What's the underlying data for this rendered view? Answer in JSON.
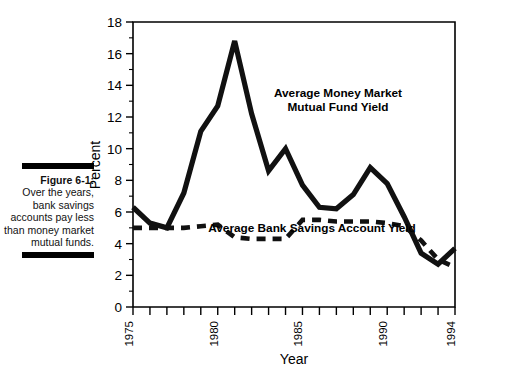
{
  "caption": {
    "label": "Figure 6-1:",
    "body": "Over the years, bank savings accounts pay less than money market mutual funds."
  },
  "chart_data": {
    "type": "line",
    "title": "",
    "xlabel": "Year",
    "ylabel": "Percent",
    "ylim": [
      0,
      18
    ],
    "ytick_step": 2,
    "yticks": [
      "0",
      "2",
      "4",
      "6",
      "8",
      "10",
      "12",
      "14",
      "16",
      "18"
    ],
    "xlim": [
      1975,
      1994
    ],
    "x": [
      1975,
      1976,
      1977,
      1978,
      1979,
      1980,
      1981,
      1982,
      1983,
      1984,
      1985,
      1986,
      1987,
      1988,
      1989,
      1990,
      1991,
      1992,
      1993,
      1994
    ],
    "xticks_labeled": [
      "1975",
      "1980",
      "1985",
      "1990",
      "1994"
    ],
    "xticks_labeled_values": [
      1975,
      1980,
      1985,
      1990,
      1994
    ],
    "grid": false,
    "legend_position": "inline-annotation",
    "series": [
      {
        "name": "Average Money Market Mutual Fund Yield",
        "style": "solid",
        "label_line1": "Average Money Market",
        "label_line2": "Mutual Fund Yield",
        "values": [
          6.3,
          5.3,
          5.0,
          7.2,
          11.1,
          12.7,
          16.8,
          12.2,
          8.6,
          10.0,
          7.7,
          6.3,
          6.2,
          7.1,
          8.8,
          7.8,
          5.7,
          3.4,
          2.7,
          3.7
        ]
      },
      {
        "name": "Average Bank Savings Account Yield",
        "style": "dashed",
        "label_line1": "Average Bank Savings Account Yield",
        "values": [
          5.0,
          5.0,
          5.0,
          5.0,
          5.1,
          5.2,
          4.4,
          4.3,
          4.3,
          4.3,
          5.5,
          5.5,
          5.4,
          5.4,
          5.4,
          5.3,
          5.1,
          4.2,
          3.0,
          2.5
        ]
      }
    ],
    "notes": {
      "peak_value": "16.8",
      "peak_year": "1981"
    }
  }
}
